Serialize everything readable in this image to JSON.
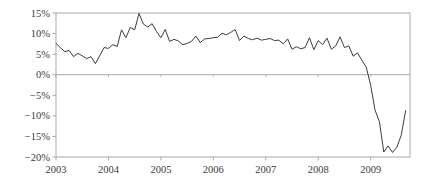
{
  "chart_data": {
    "type": "line",
    "title": "",
    "subtitle": "",
    "xlabel": "",
    "ylabel": "",
    "grid": false,
    "legend": null,
    "legend_position": "none",
    "line_color": "#3c3c3c",
    "axis_color": "#a9a9a9",
    "zero_line_color": "#a9a9a9",
    "background_color": "#ffffff",
    "xlim": [
      2003.0,
      2009.75
    ],
    "ylim": [
      -20,
      15
    ],
    "y_ticks": [
      15,
      10,
      5,
      0,
      -5,
      -10,
      -15,
      -20
    ],
    "y_tick_labels": [
      "15%",
      "10%",
      "5%",
      "0%",
      "−5%",
      "−10%",
      "−15%",
      "−20%"
    ],
    "x_ticks": [
      2003,
      2004,
      2005,
      2006,
      2007,
      2008,
      2009
    ],
    "x_tick_labels": [
      "2003",
      "2004",
      "2005",
      "2006",
      "2007",
      "2008",
      "2009"
    ],
    "series": [
      {
        "name": "series-1",
        "x": [
          2003.0,
          2003.083,
          2003.167,
          2003.25,
          2003.333,
          2003.417,
          2003.5,
          2003.583,
          2003.667,
          2003.75,
          2003.833,
          2003.917,
          2004.0,
          2004.083,
          2004.167,
          2004.25,
          2004.333,
          2004.417,
          2004.5,
          2004.583,
          2004.667,
          2004.75,
          2004.833,
          2004.917,
          2005.0,
          2005.083,
          2005.167,
          2005.25,
          2005.333,
          2005.417,
          2005.5,
          2005.583,
          2005.667,
          2005.75,
          2005.833,
          2005.917,
          2006.0,
          2006.083,
          2006.167,
          2006.25,
          2006.333,
          2006.417,
          2006.5,
          2006.583,
          2006.667,
          2006.75,
          2006.833,
          2006.917,
          2007.0,
          2007.083,
          2007.167,
          2007.25,
          2007.333,
          2007.417,
          2007.5,
          2007.583,
          2007.667,
          2007.75,
          2007.833,
          2007.917,
          2008.0,
          2008.083,
          2008.167,
          2008.25,
          2008.333,
          2008.417,
          2008.5,
          2008.583,
          2008.667,
          2008.75,
          2008.833,
          2008.917,
          2009.0,
          2009.083,
          2009.167,
          2009.25,
          2009.333,
          2009.417,
          2009.5,
          2009.583,
          2009.667
        ],
        "values": [
          7.6,
          6.6,
          5.6,
          5.9,
          4.4,
          5.2,
          4.6,
          3.9,
          4.4,
          2.7,
          4.6,
          6.6,
          6.4,
          7.3,
          6.9,
          10.9,
          9.0,
          11.5,
          10.9,
          14.9,
          12.3,
          11.6,
          12.4,
          10.5,
          9.0,
          11.0,
          8.1,
          8.6,
          8.2,
          7.3,
          7.6,
          8.1,
          9.4,
          7.8,
          8.7,
          8.8,
          9.0,
          9.1,
          10.1,
          9.7,
          10.3,
          11.0,
          8.3,
          9.4,
          8.8,
          8.5,
          8.9,
          8.4,
          8.6,
          8.8,
          8.3,
          8.4,
          7.5,
          8.7,
          6.2,
          6.8,
          6.3,
          6.6,
          9.0,
          6.1,
          8.3,
          7.3,
          8.9,
          6.2,
          7.0,
          9.2,
          6.6,
          7.0,
          4.5,
          5.3,
          3.5,
          1.8,
          -2.6,
          -8.6,
          -11.4,
          -18.8,
          -17.3,
          -18.9,
          -17.6,
          -14.7,
          -8.7
        ]
      }
    ],
    "annotations": [],
    "peak": {
      "label": "15%",
      "x": 2004.583
    },
    "trough": {
      "label": "−19%",
      "x": 2009.417
    }
  },
  "geometry": {
    "plot_left": 56,
    "plot_right": 410,
    "plot_top": 13,
    "plot_bottom": 157
  }
}
